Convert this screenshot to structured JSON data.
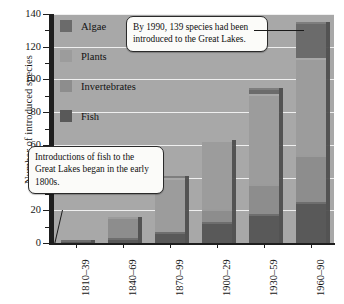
{
  "chart_data": {
    "type": "bar",
    "title": "",
    "xlabel": "",
    "ylabel": "Number of introduced species",
    "ylim": [
      0,
      140
    ],
    "ytick_step": 20,
    "yminor_step": 10,
    "grid": "horizontal-white",
    "stacked": true,
    "legend_position": "inside-top-left",
    "categories": [
      "1810–39",
      "1840–69",
      "1870–99",
      "1900–29",
      "1930–59",
      "1960–90"
    ],
    "series": [
      {
        "name": "Fish",
        "color": "#595959",
        "values": [
          2,
          3,
          7,
          13,
          18,
          25
        ]
      },
      {
        "name": "Invertebrates",
        "color": "#8d8d8d",
        "values": [
          0,
          13,
          0,
          8,
          18,
          29
        ]
      },
      {
        "name": "Plants",
        "color": "#9c9c9c",
        "values": [
          0,
          0,
          33,
          42,
          55,
          59
        ]
      },
      {
        "name": "Algae",
        "color": "#6b6b6b",
        "values": [
          0,
          0,
          1,
          0,
          4,
          22
        ]
      }
    ],
    "totals": [
      2,
      16,
      41,
      63,
      95,
      135
    ],
    "annotations": [
      "By 1990, 139 species had been introduced to the Great Lakes.",
      "Introductions of fish to the Great Lakes began in the early 1800s."
    ]
  },
  "legend": {
    "items": [
      {
        "label": "Algae",
        "color": "#6b6b6b"
      },
      {
        "label": "Plants",
        "color": "#9c9c9c"
      },
      {
        "label": "Invertebrates",
        "color": "#8d8d8d"
      },
      {
        "label": "Fish",
        "color": "#595959"
      }
    ]
  },
  "callouts": {
    "species_1990": "By 1990, 139 species had been introduced to the Great Lakes.",
    "fish_1800s": "Introductions of fish to the Great Lakes began in the early 1800s."
  },
  "colors": {
    "plot_background": "#a8a8a8",
    "gridline": "#f2f2f2",
    "axis": "#1e1e1e",
    "bar_side_shadow": "#4e4e4e",
    "callout_background": "#fbfbf9"
  }
}
